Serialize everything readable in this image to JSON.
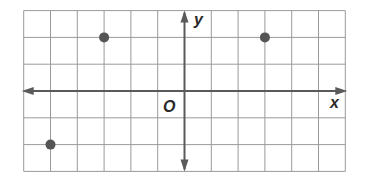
{
  "chart_data": {
    "type": "scatter",
    "title": "",
    "xlabel": "x",
    "ylabel": "y",
    "origin_label": "O",
    "xlim": [
      -6,
      6
    ],
    "ylim": [
      -3,
      3
    ],
    "grid": true,
    "tick_labels": false,
    "points": [
      {
        "x": -3,
        "y": 2
      },
      {
        "x": 3,
        "y": 2
      },
      {
        "x": -5,
        "y": -2
      }
    ]
  },
  "colors": {
    "grid": "#9a9a9a",
    "axis": "#5a5a5a",
    "point": "#555555",
    "label": "#2a2a2a"
  }
}
